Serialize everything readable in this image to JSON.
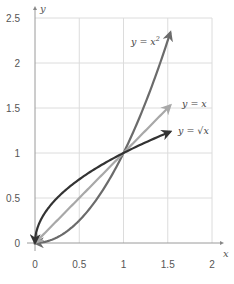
{
  "chart_data": {
    "type": "line",
    "title": "",
    "xlabel": "x",
    "ylabel": "y",
    "xlim": [
      0,
      2
    ],
    "ylim": [
      0,
      2.5
    ],
    "grid": true,
    "x_ticks": [
      "0",
      "0.5",
      "1",
      "1.5",
      "2"
    ],
    "y_ticks": [
      "0",
      "0.5",
      "1",
      "1.5",
      "2",
      "2.5"
    ],
    "series": [
      {
        "name": "y = x²",
        "label_text": "y = x",
        "label_sup": "2",
        "color": "#6b6b6b",
        "x": [
          0,
          0.25,
          0.5,
          0.75,
          1,
          1.25,
          1.53
        ],
        "values": [
          0,
          0.0625,
          0.25,
          0.5625,
          1,
          1.5625,
          2.34
        ]
      },
      {
        "name": "y = x",
        "label_text": "y = x",
        "color": "#a8a8a8",
        "x": [
          0,
          0.5,
          1,
          1.53
        ],
        "values": [
          0,
          0.5,
          1,
          1.53
        ]
      },
      {
        "name": "y = √x",
        "label_text": "y = √x",
        "color": "#333333",
        "x": [
          0,
          0.0625,
          0.25,
          0.5,
          0.75,
          1,
          1.25,
          1.53
        ],
        "values": [
          0,
          0.25,
          0.5,
          0.707,
          0.866,
          1,
          1.118,
          1.237
        ]
      }
    ],
    "annotations": [
      "y = x²",
      "y = x",
      "y = √x"
    ],
    "legend_position": "inline labels near curve ends"
  }
}
